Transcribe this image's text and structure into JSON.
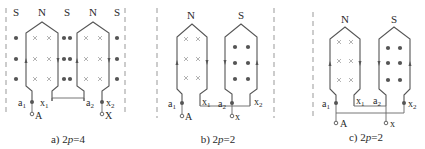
{
  "figure": {
    "panels": [
      {
        "id": "a",
        "caption_prefix": "a) 2",
        "caption_p": "p",
        "caption_suffix": "=4",
        "poles": [
          "S",
          "N",
          "S",
          "N",
          "S"
        ],
        "terminals": {
          "a1": "a",
          "a1_sub": "1",
          "x1": "x",
          "x1_sub": "1",
          "a2": "a",
          "a2_sub": "2",
          "x2": "x",
          "x2_sub": "2",
          "start": "A",
          "end": "X"
        }
      },
      {
        "id": "b",
        "caption_prefix": "b) 2",
        "caption_p": "p",
        "caption_suffix": "=2",
        "poles": [
          "N",
          "S"
        ],
        "terminals": {
          "a1": "a",
          "a1_sub": "1",
          "x1": "x",
          "x1_sub": "1",
          "a2": "a",
          "a2_sub": "2",
          "x2": "x",
          "x2_sub": "2",
          "start": "A",
          "end": "x"
        }
      },
      {
        "id": "c",
        "caption_prefix": "c) 2",
        "caption_p": "p",
        "caption_suffix": "=2",
        "poles": [
          "N",
          "S"
        ],
        "terminals": {
          "a1": "a",
          "a1_sub": "1",
          "x1": "x",
          "x1_sub": "1",
          "a2": "a",
          "a2_sub": "2",
          "x2": "x",
          "x2_sub": "2",
          "start": "A",
          "end": "x"
        }
      }
    ],
    "symbols": {
      "current_into_page": "×",
      "current_out_of_page": "●",
      "terminal": "○"
    }
  }
}
